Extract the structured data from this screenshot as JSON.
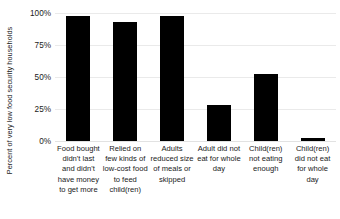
{
  "chart_data": {
    "type": "bar",
    "title": "",
    "subtitle": "",
    "xlabel": "",
    "ylabel": "Percent of very low food security households",
    "ylim": [
      0,
      100
    ],
    "grid": true,
    "legend": false,
    "orientation": "vertical",
    "bar_color": "#000000",
    "gridline_color": "#eaeaea",
    "categories": [
      "Food bought didn't last and didn't have money to get more",
      "Relied on few kinds of low-cost food to feed child(ren)",
      "Adults reduced size of meals or skipped",
      "Adult did not eat for whole day",
      "Child(ren) not eating enough",
      "Child(ren) did not eat for whole day"
    ],
    "values": [
      98,
      93,
      98,
      28,
      52,
      2
    ],
    "y_ticks": [
      0,
      25,
      50,
      75,
      100
    ],
    "y_tick_labels": [
      "0%",
      "25%",
      "50%",
      "75%",
      "100%"
    ]
  },
  "axis": {
    "y_title": "Percent of very low food security households"
  }
}
